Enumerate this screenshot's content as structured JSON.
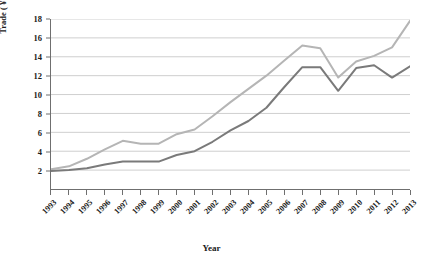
{
  "chart_data": {
    "type": "line",
    "title": "",
    "xlabel": "Year",
    "ylabel": "Trade ( ¥1 billion )",
    "ylim": [
      0,
      18
    ],
    "yticks": [
      2,
      4,
      6,
      8,
      10,
      12,
      14,
      16,
      18
    ],
    "grid": true,
    "legend": "none",
    "categories": [
      "1993",
      "1994",
      "1995",
      "1996",
      "1997",
      "1998",
      "1999",
      "2000",
      "2001",
      "2002",
      "2003",
      "2004",
      "2005",
      "2006",
      "2007",
      "2008",
      "2009",
      "2010",
      "2011",
      "2012",
      "2013"
    ],
    "series": [
      {
        "name": "series-light",
        "color": "#b5b5b5",
        "values": [
          2.1,
          2.4,
          3.2,
          4.2,
          5.1,
          4.8,
          4.8,
          5.8,
          6.3,
          7.7,
          9.2,
          10.6,
          12.0,
          13.6,
          15.2,
          14.9,
          11.8,
          13.5,
          14.1,
          15.0,
          17.8
        ]
      },
      {
        "name": "series-dark",
        "color": "#7a7a7a",
        "values": [
          1.9,
          2.0,
          2.2,
          2.6,
          2.9,
          2.9,
          2.9,
          3.6,
          4.0,
          5.0,
          6.2,
          7.2,
          8.6,
          10.8,
          12.9,
          12.9,
          10.4,
          12.8,
          13.1,
          11.8,
          13.0
        ]
      }
    ]
  }
}
